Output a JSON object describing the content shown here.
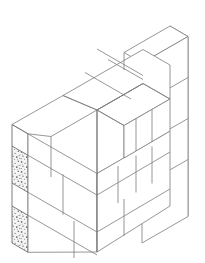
{
  "figure": {
    "background_color": "#ffffff",
    "line_color": "#7c7c7c",
    "line_color_dark": "#5e5e5e",
    "face_color": "#ffffff",
    "texture_color": "#6a6a6a",
    "texture_fill_color": "#f2f2f2",
    "line_width": 0.8,
    "projection": "isometric",
    "canvas": {
      "width": 205,
      "height": 263
    }
  },
  "geometry": {
    "units": "pixels",
    "iso_axis_left_dx": -1.0,
    "iso_axis_left_dy": 0.58,
    "iso_axis_right_dx": 1.0,
    "iso_axis_right_dy": 0.58,
    "course_height": 41,
    "courses": 4,
    "wall_segments": [
      {
        "name": "left-wing",
        "direction": "right-descending",
        "length_blocks": 2
      },
      {
        "name": "right-wing",
        "direction": "right-ascending",
        "length_blocks": 3
      },
      {
        "name": "back-return",
        "direction": "right-ascending",
        "length_blocks": 2
      }
    ]
  },
  "annotations": {
    "textured_faces": [
      {
        "name": "upper-cut-block-end",
        "course": 2
      },
      {
        "name": "lower-cut-block-end",
        "course": 4
      }
    ],
    "texture_style": "stipple-aggregate"
  },
  "paths": {
    "top_faces": [
      "M 97 49 L 185 100 L 185 100 L 97 49 Z"
    ]
  }
}
